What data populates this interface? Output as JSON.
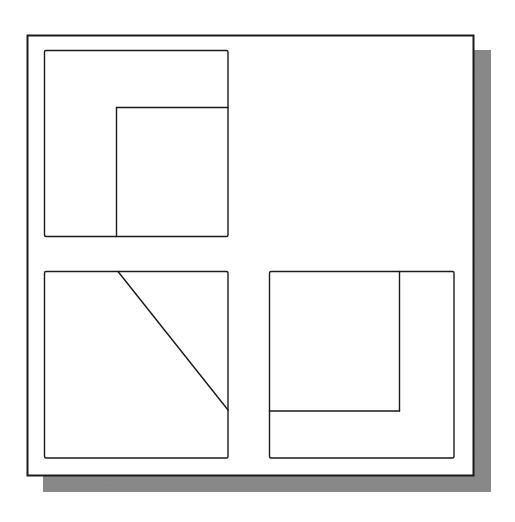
{
  "diagram": {
    "type": "orthographic-projection",
    "colors": {
      "background": "#ffffff",
      "paper": "#ffffff",
      "line": "#1a1a1a",
      "shadow": "#8c8c8c"
    },
    "sheet": {
      "frame": {
        "x": 27.5,
        "y": 35.5,
        "w": 446,
        "h": 440
      },
      "shadow": {
        "x": 43,
        "y": 50,
        "w": 448,
        "h": 442
      }
    },
    "views": [
      {
        "name": "top-left-view",
        "outline": {
          "x": 44.5,
          "y": 50.5,
          "w": 183.5,
          "h": 186
        },
        "lines": [
          {
            "x1": 116.5,
            "y1": 107.5,
            "x2": 228,
            "y2": 107.5
          },
          {
            "x1": 116.5,
            "y1": 107.5,
            "x2": 116.5,
            "y2": 236.5
          }
        ]
      },
      {
        "name": "bottom-left-view",
        "outline": {
          "x": 44.5,
          "y": 271.5,
          "w": 183.5,
          "h": 186.5
        },
        "lines": [
          {
            "x1": 118,
            "y1": 271.5,
            "x2": 228,
            "y2": 410
          }
        ]
      },
      {
        "name": "bottom-right-view",
        "outline": {
          "x": 269.5,
          "y": 271.5,
          "w": 184.5,
          "h": 186.5
        },
        "lines": [
          {
            "x1": 399.5,
            "y1": 271.5,
            "x2": 399.5,
            "y2": 411
          },
          {
            "x1": 269.5,
            "y1": 411,
            "x2": 399.5,
            "y2": 411
          }
        ]
      }
    ]
  }
}
